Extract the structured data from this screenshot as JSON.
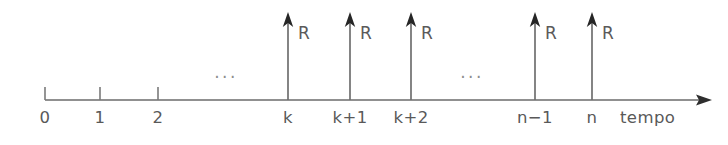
{
  "diagram": {
    "axis": {
      "caption": "tempo",
      "line_color": "#6b6b6b",
      "arrowhead_color": "#2e2e2e",
      "baseline_y": 100,
      "start_x": 45,
      "end_x": 712
    },
    "flow_label_color": "#5a5a5a",
    "tick_label_color": "#595959",
    "ellipsis_color": "#8d8d8d",
    "ticks": [
      {
        "label": "0",
        "x": 45,
        "has_flow": false
      },
      {
        "label": "1",
        "x": 100,
        "has_flow": false
      },
      {
        "label": "2",
        "x": 158,
        "has_flow": false
      },
      {
        "label": "k",
        "x": 288,
        "has_flow": true,
        "flow_label": "R"
      },
      {
        "label": "k+1",
        "x": 350,
        "has_flow": true,
        "flow_label": "R"
      },
      {
        "label": "k+2",
        "x": 411,
        "has_flow": true,
        "flow_label": "R"
      },
      {
        "label": "n−1",
        "x": 535,
        "has_flow": true,
        "flow_label": "R"
      },
      {
        "label": "n",
        "x": 592,
        "has_flow": true,
        "flow_label": "R"
      }
    ],
    "ellipses": [
      {
        "text": "...",
        "x": 226,
        "y": 78
      },
      {
        "text": "...",
        "x": 472,
        "y": 78
      }
    ]
  }
}
